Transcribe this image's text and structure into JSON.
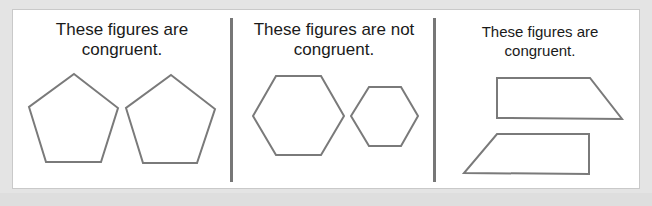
{
  "sections": [
    {
      "caption_line1": "These figures are",
      "caption_line2": "congruent.",
      "shape_type": "pentagon",
      "congruent": true,
      "shapes": [
        "74,74 118,108 101,162 46,162 29,107",
        "171,75 215,109 197,163 143,163 126,108"
      ]
    },
    {
      "caption_line1": "These figures are not",
      "caption_line2": "congruent.",
      "shape_type": "hexagon",
      "congruent": false,
      "shapes": [
        "276,76 321,76 344,116 321,155 276,155 253,116",
        "369,87 401,87 418,116 401,146 369,146 351,116"
      ]
    },
    {
      "caption_line1": "These figures are",
      "caption_line2": "congruent.",
      "shape_type": "trapezoid",
      "congruent": true,
      "shapes": [
        "497,78 590,78 622,119 497,118",
        "497,134 589,134 589,174 464,173"
      ]
    }
  ],
  "colors": {
    "background": "#e4e4e4",
    "panel": "#ffffff",
    "shape_stroke": "#7a7a7a",
    "divider": "#777777",
    "text": "#1a1a1a"
  }
}
